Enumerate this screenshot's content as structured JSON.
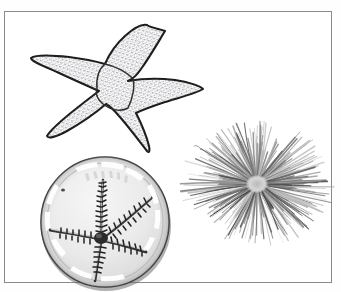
{
  "plate": {
    "title": "Echinoderm specimen plate",
    "background_color": "#ffffff",
    "border_color": "#8a8a8a",
    "border": {
      "x": 4,
      "y": 11,
      "width": 328,
      "height": 272
    },
    "text_labels": [],
    "visible_text": ""
  },
  "figures": [
    {
      "id": "sea-star",
      "name": "sea star line drawing",
      "common_name": "Sea star (starfish)",
      "render_style": "ink line drawing with stippled texture",
      "position": "top-left",
      "bounds": {
        "x": 22,
        "y": 14,
        "width": 180,
        "height": 128
      },
      "arm_count": 5,
      "outline_color": "#1f1f1f",
      "fill_color": "#ffffff",
      "stipple_color": "#7d7d86",
      "central_disc": {
        "cx": 92,
        "cy": 60,
        "shape": "pentagon"
      },
      "arm_tips": [
        {
          "label": "upper-right arm",
          "x": 138,
          "y": 6
        },
        {
          "label": "right arm",
          "x": 176,
          "y": 62
        },
        {
          "label": "lower-right arm",
          "x": 122,
          "y": 124
        },
        {
          "label": "lower-left arm",
          "x": 20,
          "y": 104
        },
        {
          "label": "left arm",
          "x": 4,
          "y": 36
        }
      ]
    },
    {
      "id": "brittle-star",
      "name": "brittle star photograph in petri dish",
      "common_name": "Brittle star (ophiuroid) in a petri dish",
      "render_style": "grayscale photograph",
      "position": "bottom-left",
      "bounds": {
        "x": 30,
        "y": 142,
        "width": 142,
        "height": 140
      },
      "arm_count": 5,
      "dish": {
        "cx": 70,
        "cy": 68,
        "rx": 66,
        "ry": 66,
        "rim_color": "#2b2b2b",
        "interior_color": "#ebebeb",
        "rim_highlight_color": "#fbfbfb"
      },
      "disc": {
        "cx": 66,
        "cy": 84,
        "r": 6
      },
      "arm_color": "#2d2d2d",
      "arm_tips": [
        {
          "label": "arm-1 (up)",
          "x": 68,
          "y": 26
        },
        {
          "label": "arm-2 (upper right)",
          "x": 116,
          "y": 44
        },
        {
          "label": "arm-3 (right)",
          "x": 110,
          "y": 98
        },
        {
          "label": "arm-4 (down)",
          "x": 60,
          "y": 128
        },
        {
          "label": "arm-5 (left)",
          "x": 14,
          "y": 76
        }
      ]
    },
    {
      "id": "sea-urchin",
      "name": "long-spined sea urchin photograph",
      "common_name": "Long-spined sea urchin",
      "render_style": "grayscale photograph",
      "position": "right",
      "bounds": {
        "x": 172,
        "y": 96,
        "width": 166,
        "height": 148
      },
      "center": {
        "cx": 80,
        "cy": 76
      },
      "spine_count": 300,
      "spine_color_dark": "#3a3a3a",
      "spine_color_light": "#c4c4c4",
      "spine_length_min": 30,
      "spine_length_max": 72,
      "test_color": "#cfcfcf"
    }
  ]
}
